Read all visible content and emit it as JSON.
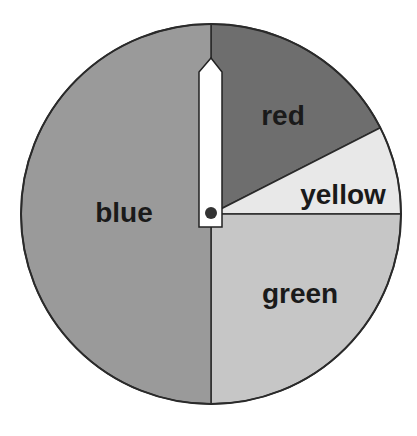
{
  "chart_data": {
    "type": "pie",
    "title": "",
    "categories": [
      "red",
      "yellow",
      "green",
      "blue"
    ],
    "values": [
      17.5,
      7.5,
      25,
      50
    ],
    "units": "percent",
    "start_angle_deg": 90,
    "direction": "clockwise",
    "colors": [
      "#6e6e6e",
      "#e8e8e8",
      "#c6c6c6",
      "#9a9a9a"
    ],
    "labels_on_slices": true,
    "legend": "none",
    "annotations": [
      "spinner hand pointing to top (12 o'clock)"
    ]
  },
  "geometry": {
    "cx": 211,
    "cy": 214,
    "r": 190
  },
  "labels": {
    "red": {
      "text": "red",
      "x": 283,
      "y": 125
    },
    "yellow": {
      "text": "yellow",
      "x": 343,
      "y": 204
    },
    "green": {
      "text": "green",
      "x": 300,
      "y": 303
    },
    "blue": {
      "text": "blue",
      "x": 124,
      "y": 222
    }
  },
  "spinner": {
    "color": "#ffffff",
    "stroke": "#222222",
    "pivot_color": "#333333"
  }
}
